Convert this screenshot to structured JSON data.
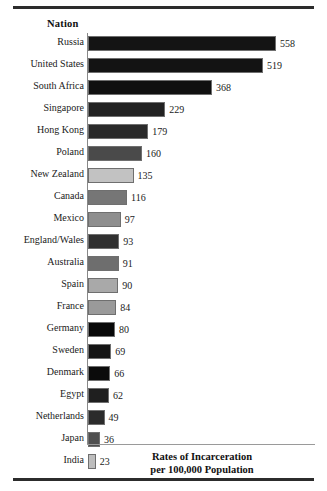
{
  "figure": {
    "column_header": "Nation",
    "caption_line1": "Rates of Incarceration",
    "caption_line2": "per 100,000 Population",
    "rule_color": "#2c2c2c",
    "axis_color": "#888888"
  },
  "chart_data": {
    "type": "bar",
    "orientation": "horizontal",
    "title": "Rates of Incarceration per 100,000 Population",
    "xlabel": "",
    "ylabel": "Nation",
    "xlim": [
      0,
      600
    ],
    "grid": false,
    "legend": "none",
    "category_header": "Nation",
    "categories": [
      "Russia",
      "United States",
      "South Africa",
      "Singapore",
      "Hong Kong",
      "Poland",
      "New Zealand",
      "Canada",
      "Mexico",
      "England/Wales",
      "Australia",
      "Spain",
      "France",
      "Germany",
      "Sweden",
      "Denmark",
      "Egypt",
      "Netherlands",
      "Japan",
      "India"
    ],
    "values": [
      558,
      519,
      368,
      229,
      179,
      160,
      135,
      116,
      97,
      93,
      91,
      90,
      84,
      80,
      69,
      66,
      62,
      49,
      36,
      23
    ],
    "bar_colors": [
      "#141414",
      "#131313",
      "#101010",
      "#222222",
      "#2a2a2a",
      "#4a4a4a",
      "#c2c2c2",
      "#767676",
      "#8e8e8e",
      "#303030",
      "#6e6e6e",
      "#a9a9a9",
      "#9a9a9a",
      "#080808",
      "#141414",
      "#0b0b0b",
      "#1f1f1f",
      "#2b2b2b",
      "#4f4f4f",
      "#bdbdbd"
    ],
    "rows": [
      {
        "nation": "Russia",
        "value": 558,
        "label": "558",
        "color": "#141414"
      },
      {
        "nation": "United States",
        "value": 519,
        "label": "519",
        "color": "#131313"
      },
      {
        "nation": "South Africa",
        "value": 368,
        "label": "368",
        "color": "#101010"
      },
      {
        "nation": "Singapore",
        "value": 229,
        "label": "229",
        "color": "#222222"
      },
      {
        "nation": "Hong Kong",
        "value": 179,
        "label": "179",
        "color": "#2a2a2a"
      },
      {
        "nation": "Poland",
        "value": 160,
        "label": "160",
        "color": "#4a4a4a"
      },
      {
        "nation": "New Zealand",
        "value": 135,
        "label": "135",
        "color": "#c2c2c2"
      },
      {
        "nation": "Canada",
        "value": 116,
        "label": "116",
        "color": "#767676"
      },
      {
        "nation": "Mexico",
        "value": 97,
        "label": "97",
        "color": "#8e8e8e"
      },
      {
        "nation": "England/Wales",
        "value": 93,
        "label": "93",
        "color": "#303030"
      },
      {
        "nation": "Australia",
        "value": 91,
        "label": "91",
        "color": "#6e6e6e"
      },
      {
        "nation": "Spain",
        "value": 90,
        "label": "90",
        "color": "#a9a9a9"
      },
      {
        "nation": "France",
        "value": 84,
        "label": "84",
        "color": "#9a9a9a"
      },
      {
        "nation": "Germany",
        "value": 80,
        "label": "80",
        "color": "#080808"
      },
      {
        "nation": "Sweden",
        "value": 69,
        "label": "69",
        "color": "#141414"
      },
      {
        "nation": "Denmark",
        "value": 66,
        "label": "66",
        "color": "#0b0b0b"
      },
      {
        "nation": "Egypt",
        "value": 62,
        "label": "62",
        "color": "#1f1f1f"
      },
      {
        "nation": "Netherlands",
        "value": 49,
        "label": "49",
        "color": "#2b2b2b"
      },
      {
        "nation": "Japan",
        "value": 36,
        "label": "36",
        "color": "#4f4f4f"
      },
      {
        "nation": "India",
        "value": 23,
        "label": "23",
        "color": "#bdbdbd"
      }
    ]
  }
}
